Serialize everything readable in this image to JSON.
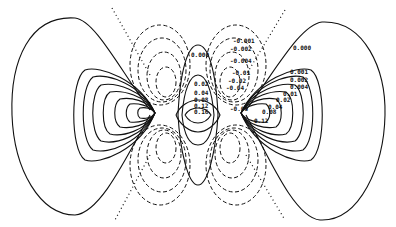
{
  "figure": {
    "type": "contour-plot",
    "colors": {
      "line": "#111111",
      "background": "#ffffff"
    },
    "line_styles": {
      "positive": "solid",
      "negative": "dashed",
      "nodal": "dotted"
    }
  },
  "labels": {
    "center": [
      "0.000",
      "0.02",
      "0.04",
      "0.08",
      "0.12",
      "0.16"
    ],
    "right": [
      "0.000",
      "0.001",
      "0.002",
      "0.004",
      "0.01",
      "0.02",
      "0.04",
      "0.08",
      "0.12"
    ],
    "negative": [
      "-0.001",
      "-0.002",
      "-0.004",
      "-0.01",
      "-0.02",
      "-0.04",
      "-0.08"
    ]
  }
}
